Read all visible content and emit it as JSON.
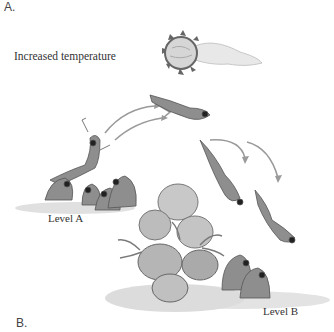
{
  "figure": {
    "panel_top_label": "A.",
    "panel_bottom_label": "B.",
    "condition_label": "Increased temperature",
    "level_a_label": "Level A",
    "level_b_label": "Level B",
    "icons": {
      "sun": "sun-with-heat-trail-icon",
      "frogs": "frog-illustration",
      "arrows": "jump-arrow-icon",
      "rocks": "rock-and-plant-cluster"
    },
    "colors": {
      "ink": "#444444",
      "shade_dark": "#6a6a6a",
      "shade_mid": "#9a9a9a",
      "shade_light": "#cfcfcf",
      "ground": "#d9d9d9"
    }
  }
}
